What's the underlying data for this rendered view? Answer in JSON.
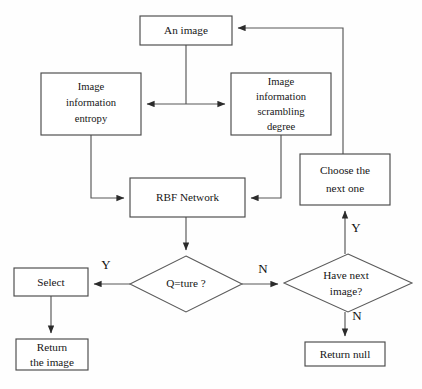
{
  "diagram": {
    "caption": "",
    "colors": {
      "background": "#fefefe",
      "stroke": "#565656",
      "box_stroke": "#4a4a4a",
      "text": "#151515"
    },
    "nodes": [
      {
        "id": "an-image",
        "shape": "box",
        "label": "An image",
        "lines": [
          "An image"
        ],
        "x": 140,
        "y": 16,
        "w": 92,
        "h": 29
      },
      {
        "id": "image-information-entropy",
        "shape": "box",
        "label": "Image information entropy",
        "lines": [
          "Image",
          "information",
          "entropy"
        ],
        "x": 41,
        "y": 73,
        "w": 100,
        "h": 62
      },
      {
        "id": "image-information-scrambling-degree",
        "shape": "box",
        "label": "Image information scrambling degree",
        "lines": [
          "Image",
          "information",
          "scrambling",
          "degree"
        ],
        "x": 231,
        "y": 73,
        "w": 100,
        "h": 62
      },
      {
        "id": "choose-the-next-one",
        "shape": "box",
        "label": "Choose the next one",
        "lines": [
          "Choose  the",
          "next one"
        ],
        "x": 300,
        "y": 154,
        "w": 90,
        "h": 51
      },
      {
        "id": "rbf-network",
        "shape": "box",
        "label": "RBF Network",
        "lines": [
          "RBF Network"
        ],
        "x": 130,
        "y": 178,
        "w": 115,
        "h": 39
      },
      {
        "id": "q-is-true",
        "shape": "diamond",
        "label": "Q=ture ?",
        "lines": [
          "Q=ture ?"
        ],
        "cx": 186,
        "cy": 284,
        "rx": 56,
        "ry": 28
      },
      {
        "id": "have-next-image",
        "shape": "diamond",
        "label": "Have next image?",
        "lines": [
          "Have next",
          "image?"
        ],
        "cx": 348,
        "cy": 283,
        "rx": 64,
        "ry": 29
      },
      {
        "id": "select",
        "shape": "box",
        "label": "Select",
        "lines": [
          "Select"
        ],
        "x": 14,
        "y": 268,
        "w": 74,
        "h": 28
      },
      {
        "id": "return-the-image",
        "shape": "box",
        "label": "Return the image",
        "lines": [
          "Return",
          "the image"
        ],
        "x": 16,
        "y": 339,
        "w": 72,
        "h": 31
      },
      {
        "id": "return-null",
        "shape": "box",
        "label": "Return null",
        "lines": [
          "Return null"
        ],
        "x": 305,
        "y": 342,
        "w": 80,
        "h": 24
      }
    ],
    "edge_labels": [
      {
        "id": "label-q-yes",
        "text": "Y",
        "x": 106,
        "y": 266
      },
      {
        "id": "label-q-no",
        "text": "N",
        "x": 263,
        "y": 270
      },
      {
        "id": "label-have-next-yes",
        "text": "Y",
        "x": 356,
        "y": 229
      },
      {
        "id": "label-have-next-no",
        "text": "N",
        "x": 357,
        "y": 317
      }
    ],
    "edges": [
      {
        "id": "an-image-to-split",
        "from": "an-image",
        "to": "split-point",
        "label": ""
      },
      {
        "id": "split-to-entropy",
        "from": "an-image",
        "to": "image-information-entropy",
        "label": ""
      },
      {
        "id": "split-to-scrambling",
        "from": "an-image",
        "to": "image-information-scrambling-degree",
        "label": ""
      },
      {
        "id": "entropy-to-rbf",
        "from": "image-information-entropy",
        "to": "rbf-network",
        "label": ""
      },
      {
        "id": "scrambling-to-rbf",
        "from": "image-information-scrambling-degree",
        "to": "rbf-network",
        "label": ""
      },
      {
        "id": "rbf-to-q",
        "from": "rbf-network",
        "to": "q-is-true",
        "label": ""
      },
      {
        "id": "q-to-select",
        "from": "q-is-true",
        "to": "select",
        "label": "Y"
      },
      {
        "id": "q-to-have-next",
        "from": "q-is-true",
        "to": "have-next-image",
        "label": "N"
      },
      {
        "id": "select-to-return-image",
        "from": "select",
        "to": "return-the-image",
        "label": ""
      },
      {
        "id": "have-next-to-choose",
        "from": "have-next-image",
        "to": "choose-the-next-one",
        "label": "Y"
      },
      {
        "id": "have-next-to-return-null",
        "from": "have-next-image",
        "to": "return-null",
        "label": "N"
      },
      {
        "id": "choose-to-an-image",
        "from": "choose-the-next-one",
        "to": "an-image",
        "label": ""
      }
    ]
  }
}
